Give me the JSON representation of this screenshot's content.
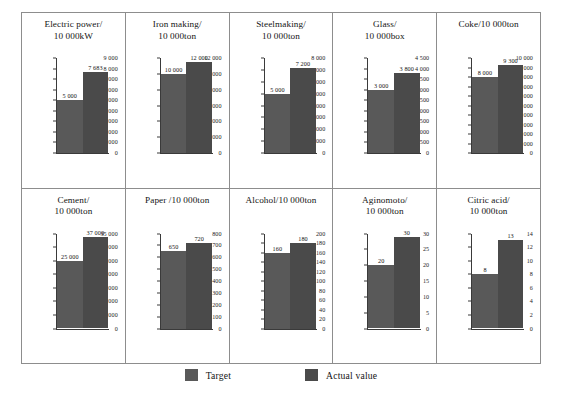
{
  "legend": {
    "target_label": "Target",
    "actual_label": "Actual value",
    "target_color": "#595959",
    "actual_color": "#4a4a4a"
  },
  "chart_data": [
    {
      "type": "bar",
      "title": "Electric power/",
      "title_line2": "10 000kW",
      "categories": [
        "Target",
        "Actual value"
      ],
      "values": [
        5000,
        7683
      ],
      "value_labels": [
        "5 000",
        "7 683"
      ],
      "ticks": [
        "9 000",
        "8 000",
        "7 000",
        "6 000",
        "5 000",
        "4 000",
        "3 000",
        "2 000",
        "1 000",
        "0"
      ],
      "ylim": [
        0,
        9000
      ],
      "grid": false,
      "legend_position": "bottom"
    },
    {
      "type": "bar",
      "title": "Iron making/",
      "title_line2": "10 000ton",
      "categories": [
        "Target",
        "Actual value"
      ],
      "values": [
        10000,
        12000
      ],
      "value_labels": [
        "10 000",
        "12 000"
      ],
      "ticks": [
        "12 000",
        "10 000",
        "8 000",
        "6 000",
        "4 000",
        "2 000",
        "0"
      ],
      "ylim": [
        0,
        12000
      ],
      "grid": false,
      "legend_position": "bottom"
    },
    {
      "type": "bar",
      "title": "Steelmaking/",
      "title_line2": "10 000ton",
      "categories": [
        "Target",
        "Actual value"
      ],
      "values": [
        5000,
        7200
      ],
      "value_labels": [
        "5 000",
        "7 200"
      ],
      "ticks": [
        "8 000",
        "7 000",
        "6 000",
        "5 000",
        "4 000",
        "3 000",
        "2 000",
        "1 000",
        "0"
      ],
      "ylim": [
        0,
        8000
      ],
      "grid": false,
      "legend_position": "bottom"
    },
    {
      "type": "bar",
      "title": "Glass/",
      "title_line2": "10 000box",
      "categories": [
        "Target",
        "Actual value"
      ],
      "values": [
        3000,
        3800
      ],
      "value_labels": [
        "3 000",
        "3 800"
      ],
      "ticks": [
        "4 500",
        "4 000",
        "3 500",
        "3 000",
        "2 500",
        "2 000",
        "1 500",
        "1 000",
        "500",
        "0"
      ],
      "ylim": [
        0,
        4500
      ],
      "grid": false,
      "legend_position": "bottom"
    },
    {
      "type": "bar",
      "title": "Coke/10 000ton",
      "title_line2": "",
      "categories": [
        "Target",
        "Actual value"
      ],
      "values": [
        8000,
        9300
      ],
      "value_labels": [
        "8 000",
        "9 300"
      ],
      "ticks": [
        "10 000",
        "9 000",
        "8 000",
        "7 000",
        "6 000",
        "5 000",
        "4 000",
        "3 000",
        "2 000",
        "1 000",
        "0"
      ],
      "ylim": [
        0,
        10000
      ],
      "grid": false,
      "legend_position": "bottom"
    },
    {
      "type": "bar",
      "title": "Cement/",
      "title_line2": "10 000ton",
      "categories": [
        "Target",
        "Actual value"
      ],
      "values": [
        25000,
        37000
      ],
      "value_labels": [
        "25 000",
        "37 000"
      ],
      "ticks": [
        "35 000",
        "30 000",
        "25 000",
        "20 000",
        "15 000",
        "10 000",
        "5 000",
        "0"
      ],
      "ylim": [
        0,
        35000
      ],
      "grid": false,
      "legend_position": "bottom"
    },
    {
      "type": "bar",
      "title": "Paper /10 000ton",
      "title_line2": "",
      "categories": [
        "Target",
        "Actual value"
      ],
      "values": [
        650,
        720
      ],
      "value_labels": [
        "650",
        "720"
      ],
      "ticks": [
        "800",
        "700",
        "600",
        "500",
        "400",
        "300",
        "200",
        "100",
        "0"
      ],
      "ylim": [
        0,
        800
      ],
      "grid": false,
      "legend_position": "bottom"
    },
    {
      "type": "bar",
      "title": "Alcohol/10 000ton",
      "title_line2": "",
      "categories": [
        "Target",
        "Actual value"
      ],
      "values": [
        160,
        180
      ],
      "value_labels": [
        "160",
        "180"
      ],
      "ticks": [
        "200",
        "180",
        "160",
        "140",
        "120",
        "100",
        "80",
        "60",
        "40",
        "20",
        "0"
      ],
      "ylim": [
        0,
        200
      ],
      "grid": false,
      "legend_position": "bottom"
    },
    {
      "type": "bar",
      "title": "Aginomoto/",
      "title_line2": "10 000ton",
      "categories": [
        "Target",
        "Actual value"
      ],
      "values": [
        20,
        30
      ],
      "value_labels": [
        "20",
        "30"
      ],
      "ticks": [
        "30",
        "25",
        "20",
        "15",
        "10",
        "5",
        "0"
      ],
      "ylim": [
        0,
        30
      ],
      "grid": false,
      "legend_position": "bottom"
    },
    {
      "type": "bar",
      "title": "Citric acid/",
      "title_line2": "10 000ton",
      "categories": [
        "Target",
        "Actual value"
      ],
      "values": [
        8,
        13
      ],
      "value_labels": [
        "8",
        "13"
      ],
      "ticks": [
        "14",
        "12",
        "10",
        "8",
        "6",
        "4",
        "2",
        "0"
      ],
      "ylim": [
        0,
        14
      ],
      "grid": false,
      "legend_position": "bottom"
    }
  ]
}
